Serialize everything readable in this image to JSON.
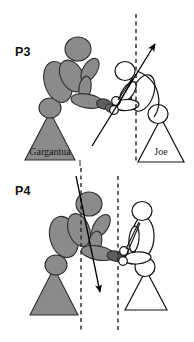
{
  "figure": {
    "background_color": "#ffffff",
    "width": 194,
    "height": 342,
    "colors": {
      "gray_fill": "#8a8a8a",
      "gray_stroke": "#3a3a3a",
      "white_fill": "#ffffff",
      "outline": "#111111",
      "dashed_line": "#222222",
      "arrow": "#000000",
      "label_text": "#111111"
    }
  },
  "panels": [
    {
      "id": "p3",
      "label": "P3",
      "label_x": 15,
      "label_y": 56,
      "actors": [
        {
          "id": "gargantua-p3",
          "name": "Gargantua",
          "label": "Gargantua",
          "label_x": 50,
          "label_y": 155,
          "fill": "gray",
          "base_shape": "triangle",
          "triangle": {
            "left_x": 25,
            "right_x": 75,
            "apex_x": 50,
            "base_y": 160,
            "apex_y": 112
          }
        },
        {
          "id": "joe-p3",
          "name": "Joe",
          "label": "Joe",
          "label_x": 161,
          "label_y": 155,
          "fill": "white",
          "base_shape": "triangle",
          "triangle": {
            "left_x": 138,
            "right_x": 184,
            "apex_x": 161,
            "base_y": 162,
            "apex_y": 118
          }
        }
      ],
      "vertical_reference_lines": [
        {
          "id": "p3-dashed-center",
          "x": 136,
          "y_top": 14,
          "y_bottom": 162,
          "style": "dashed"
        }
      ],
      "force_arrows": [
        {
          "id": "p3-force-arrow",
          "direction": "up-right",
          "from_x": 92,
          "from_y": 146,
          "to_x": 157,
          "to_y": 42
        }
      ]
    },
    {
      "id": "p4",
      "label": "P4",
      "label_x": 15,
      "label_y": 195,
      "actors": [
        {
          "id": "gargantua-p4",
          "name": "Gargantua",
          "label": "",
          "fill": "gray",
          "base_shape": "triangle",
          "triangle": {
            "left_x": 30,
            "right_x": 78,
            "apex_x": 54,
            "base_y": 315,
            "apex_y": 268
          }
        },
        {
          "id": "joe-p4",
          "name": "Joe",
          "label": "",
          "fill": "white",
          "base_shape": "triangle",
          "triangle": {
            "left_x": 125,
            "right_x": 167,
            "apex_x": 146,
            "base_y": 310,
            "apex_y": 270
          }
        }
      ],
      "vertical_reference_lines": [
        {
          "id": "p4-dashed-left",
          "x": 81,
          "y_top": 168,
          "y_bottom": 330,
          "style": "dashed"
        },
        {
          "id": "p4-dashed-right",
          "x": 118,
          "y_top": 176,
          "y_bottom": 330,
          "style": "dashed"
        }
      ],
      "force_arrows": [
        {
          "id": "p4-force-arrow",
          "direction": "down-right",
          "from_x": 76,
          "from_y": 176,
          "to_x": 101,
          "to_y": 297
        }
      ]
    }
  ]
}
